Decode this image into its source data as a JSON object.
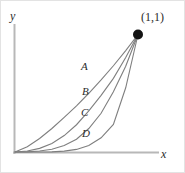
{
  "figure": {
    "background_color": "#ffffff",
    "border_color": "#e3e3e3",
    "axis_color": "#b8b8b8",
    "curve_color": "#808080",
    "text_color": "#2b2b2b",
    "point_color": "#111111"
  },
  "axes": {
    "y_label": "y",
    "x_label": "x"
  },
  "annotations": {
    "endpoint_label": "(1,1)"
  },
  "curves": [
    {
      "id": "A",
      "label": "A",
      "exponent": 1.35,
      "label_x": 80,
      "label_y": 59
    },
    {
      "id": "B",
      "label": "B",
      "exponent": 2.1,
      "label_x": 81,
      "label_y": 84
    },
    {
      "id": "C",
      "label": "C",
      "exponent": 3.2,
      "label_x": 80,
      "label_y": 105
    },
    {
      "id": "D",
      "label": "D",
      "exponent": 5.5,
      "label_x": 81,
      "label_y": 126
    }
  ],
  "chart_data": {
    "type": "line",
    "title": "",
    "xlabel": "x",
    "ylabel": "y",
    "xlim": [
      0,
      1.15
    ],
    "ylim": [
      0,
      1.15
    ],
    "grid": false,
    "legend": "inline-curve-labels",
    "annotations": [
      {
        "text": "(1,1)",
        "x": 1,
        "y": 1,
        "marker": "filled-circle"
      }
    ],
    "series": [
      {
        "name": "A",
        "description": "slightly convex curve from (0,0) to (1,1), nearest the straight diagonal",
        "x": [
          0,
          0.1,
          0.2,
          0.3,
          0.4,
          0.5,
          0.6,
          0.7,
          0.8,
          0.9,
          1
        ],
        "y": [
          0,
          0.045,
          0.115,
          0.2,
          0.295,
          0.393,
          0.5,
          0.613,
          0.734,
          0.863,
          1
        ]
      },
      {
        "name": "B",
        "description": "convex curve, approximately y = x^2",
        "x": [
          0,
          0.1,
          0.2,
          0.3,
          0.4,
          0.5,
          0.6,
          0.7,
          0.8,
          0.9,
          1
        ],
        "y": [
          0,
          0.008,
          0.031,
          0.073,
          0.14,
          0.232,
          0.35,
          0.482,
          0.627,
          0.805,
          1
        ]
      },
      {
        "name": "C",
        "description": "more convex curve, approximately y = x^3",
        "x": [
          0,
          0.1,
          0.2,
          0.3,
          0.4,
          0.5,
          0.6,
          0.7,
          0.8,
          0.9,
          1
        ],
        "y": [
          0,
          0.001,
          0.008,
          0.024,
          0.055,
          0.109,
          0.2,
          0.33,
          0.512,
          0.73,
          1
        ]
      },
      {
        "name": "D",
        "description": "most convex curve, hugs the x-axis, approximately y = x^5.5",
        "x": [
          0,
          0.1,
          0.2,
          0.3,
          0.4,
          0.5,
          0.6,
          0.7,
          0.8,
          0.9,
          1
        ],
        "y": [
          0,
          0.0,
          0.0001,
          0.0013,
          0.0074,
          0.0221,
          0.0553,
          0.1207,
          0.2352,
          0.5466,
          1
        ]
      }
    ]
  }
}
